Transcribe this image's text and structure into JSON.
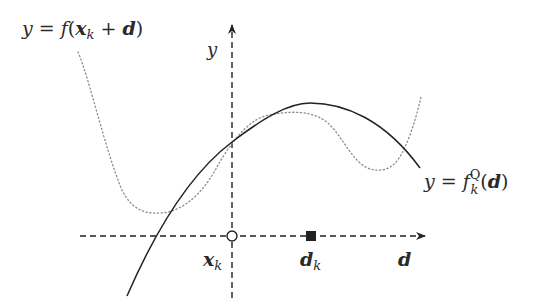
{
  "diagram": {
    "type": "function-approximation-sketch",
    "colors": {
      "ink": "#222222",
      "dotted_curve": "#8a8a8a",
      "background": "#ffffff"
    },
    "axes": {
      "vertical_label": "y",
      "horizontal_label": "d",
      "horizontal_style": "dashed",
      "vertical_style": "dashed"
    },
    "curves": [
      {
        "name": "true-function",
        "style": "dotted",
        "label_lhs": "y = ",
        "label_func": "f",
        "label_open": "(",
        "label_x": "x",
        "label_x_sub": "k",
        "label_plus": " + ",
        "label_d": "d",
        "label_close": ")"
      },
      {
        "name": "quadratic-model",
        "style": "solid",
        "label_lhs": "y = ",
        "label_func": "f",
        "label_sup": "Q",
        "label_sub": "k",
        "label_open": "(",
        "label_d": "d",
        "label_close": ")"
      }
    ],
    "points": [
      {
        "name": "current-point",
        "marker": "open-circle",
        "label_main": "x",
        "label_sub": "k"
      },
      {
        "name": "step",
        "marker": "filled-square",
        "label_main": "d",
        "label_sub": "k"
      }
    ]
  }
}
